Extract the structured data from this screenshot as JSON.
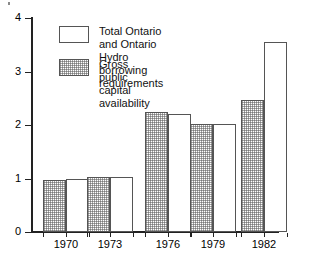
{
  "chart_data": {
    "type": "bar",
    "title": "",
    "subtitle": "",
    "xlabel": "",
    "ylabel": "",
    "categories": [
      "1970",
      "1973",
      "1976",
      "1979",
      "1982"
    ],
    "series": [
      {
        "name": "Gross public capital availability",
        "style": "hatched",
        "values": [
          0.97,
          1.02,
          2.24,
          2.02,
          2.47
        ]
      },
      {
        "name": "Total Ontario and Ontario Hydro borrowing requirements",
        "style": "white",
        "values": [
          1.0,
          1.02,
          2.2,
          2.02,
          3.55
        ]
      }
    ],
    "ylim": [
      0,
      4
    ],
    "yticks": [
      0,
      1,
      2,
      3,
      4
    ],
    "ytick_labels": [
      "0",
      "1",
      "2",
      "3",
      "4"
    ],
    "grid": false,
    "legend_position": "upper-left-inside",
    "legend": [
      {
        "label": "Total Ontario and Ontario Hydro\nborrowing requirements",
        "style": "white"
      },
      {
        "label": "Gross public capital availability",
        "style": "hatched"
      }
    ]
  },
  "axes": {
    "y_labels": [
      "4",
      "3",
      "2",
      "1",
      "0"
    ],
    "x_labels": [
      "1970",
      "1973",
      "1976",
      "1979",
      "1982"
    ]
  },
  "colors": {
    "axis": "#222222",
    "bar_outline": "#555555",
    "bar_fill_white": "#ffffff",
    "bar_hatch": "#5a5a5a",
    "background": "#ffffff",
    "text": "#111111"
  }
}
